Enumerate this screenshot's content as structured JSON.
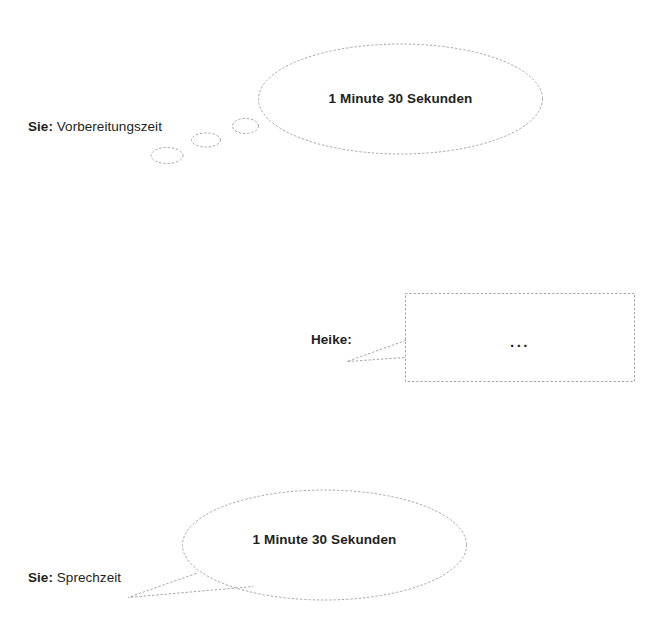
{
  "document": {
    "title": "Sprechzeit Diagramm",
    "language": "de",
    "background_color": "#ffffff",
    "text_color": "#231f20",
    "outline_color": "#a6a6a6",
    "outline_style": "dotted"
  },
  "rows": [
    {
      "id": "preparation",
      "speaker": "Sie:",
      "topic": "Vorbereitungszeit",
      "balloon_kind": "thought-cloud",
      "balloon_text": "1 Minute 30 Sekunden"
    },
    {
      "id": "partner-turn",
      "speaker": "Heike:",
      "topic": "",
      "balloon_kind": "rectangle-callout",
      "balloon_text": "..."
    },
    {
      "id": "speaking",
      "speaker": "Sie:",
      "topic": "Sprechzeit",
      "balloon_kind": "speech-ellipse",
      "balloon_text": "1 Minute 30 Sekunden"
    }
  ],
  "shapes": {
    "thought_tail_bubbles": 3,
    "icons": {
      "thought_cloud": "thought-cloud-icon",
      "speech_balloon": "speech-balloon-icon",
      "rectangle_callout": "rectangle-callout-icon"
    }
  }
}
